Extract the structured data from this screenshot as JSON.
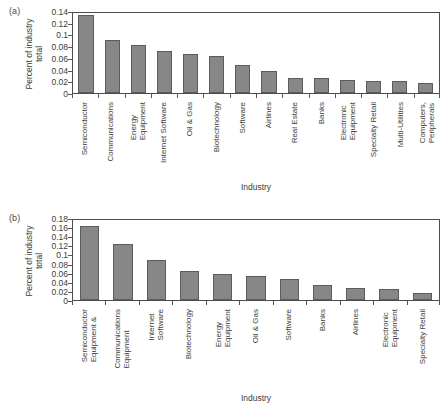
{
  "figure": {
    "background": "#ffffff",
    "bar_color": "#878787",
    "bar_edge_color": "#5c5c5c",
    "axis_color": "#4d4d4d"
  },
  "panels": [
    {
      "letter": "(a)",
      "ylabel_line1": "Percent of industry",
      "ylabel_line2": "total",
      "xlabel": "Industry",
      "yticks": [
        "0",
        "0.02",
        "0.04",
        "0.06",
        "0.08",
        "0.1",
        "0.12",
        "0.14"
      ],
      "categories": [
        [
          "Semiconductor"
        ],
        [
          "Communications"
        ],
        [
          "Energy",
          "Equipment"
        ],
        [
          "Internet Software"
        ],
        [
          "Oil & Gas"
        ],
        [
          "Biotechnology"
        ],
        [
          "Software"
        ],
        [
          "Airlines"
        ],
        [
          "Real Estate"
        ],
        [
          "Banks"
        ],
        [
          "Electronic",
          "Equipment"
        ],
        [
          "Specialty Retail"
        ],
        [
          "Multi-Utilities"
        ],
        [
          "Computers,",
          "Peripherals"
        ]
      ]
    },
    {
      "letter": "(b)",
      "ylabel_line1": "Percent of industry",
      "ylabel_line2": "total",
      "xlabel": "Industry",
      "yticks": [
        "0",
        "0.02",
        "0.04",
        "0.06",
        "0.08",
        "0.1",
        "0.12",
        "0.14",
        "0.16",
        "0.18"
      ],
      "categories": [
        [
          "Semiconductor",
          "Equipment &"
        ],
        [
          "Communications",
          "Equipment"
        ],
        [
          "Internet",
          "Software"
        ],
        [
          "Biotechnology"
        ],
        [
          "Energy",
          "Equipment"
        ],
        [
          "Oil & Gas"
        ],
        [
          "Software"
        ],
        [
          "Banks"
        ],
        [
          "Airlines"
        ],
        [
          "Electronic",
          "Equipment"
        ],
        [
          "Specialty Retail"
        ]
      ]
    }
  ],
  "chart_data": [
    {
      "type": "bar",
      "panel": "(a)",
      "title": "",
      "xlabel": "Industry",
      "ylabel": "Percent of industry total",
      "ylim": [
        0,
        0.14
      ],
      "ytick_values": [
        0,
        0.02,
        0.04,
        0.06,
        0.08,
        0.1,
        0.12,
        0.14
      ],
      "grid": false,
      "legend": null,
      "categories": [
        "Semiconductor",
        "Communications",
        "Energy Equipment",
        "Internet Software",
        "Oil & Gas",
        "Biotechnology",
        "Software",
        "Airlines",
        "Real Estate",
        "Banks",
        "Electronic Equipment",
        "Specialty Retail",
        "Multi-Utilities",
        "Computers, Peripherals"
      ],
      "values": [
        0.133,
        0.09,
        0.082,
        0.071,
        0.067,
        0.0625,
        0.048,
        0.037,
        0.026,
        0.025,
        0.0215,
        0.0205,
        0.0198,
        0.0165
      ]
    },
    {
      "type": "bar",
      "panel": "(b)",
      "title": "",
      "xlabel": "Industry",
      "ylabel": "Percent of industry total",
      "ylim": [
        0,
        0.18
      ],
      "ytick_values": [
        0,
        0.02,
        0.04,
        0.06,
        0.08,
        0.1,
        0.12,
        0.14,
        0.16,
        0.18
      ],
      "grid": false,
      "legend": null,
      "categories": [
        "Semiconductor Equipment &",
        "Communications Equipment",
        "Internet Software",
        "Biotechnology",
        "Energy Equipment",
        "Oil & Gas",
        "Software",
        "Banks",
        "Airlines",
        "Electronic Equipment",
        "Specialty Retail"
      ],
      "values": [
        0.163,
        0.122,
        0.087,
        0.064,
        0.058,
        0.053,
        0.046,
        0.032,
        0.026,
        0.024,
        0.015
      ]
    }
  ]
}
